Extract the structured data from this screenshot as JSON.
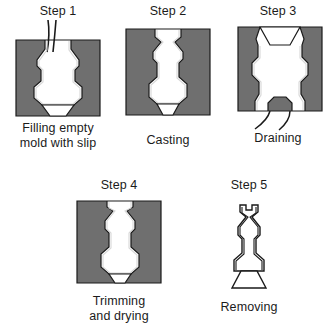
{
  "figure": {
    "background_color": "#ffffff",
    "mold_color": "#6f6f6f",
    "slip_color": "#ffffff",
    "outline_color": "#1a1a1a"
  },
  "steps": [
    {
      "id": "step-1",
      "title": "Step 1",
      "caption_lines": [
        "Filling empty",
        "mold with slip"
      ],
      "caption": "Filling empty mold with slip",
      "art": "mold-empty-with-pouring-slip"
    },
    {
      "id": "step-2",
      "title": "Step 2",
      "caption_lines": [
        "Casting"
      ],
      "caption": "Casting",
      "art": "mold-filled-with-slip"
    },
    {
      "id": "step-3",
      "title": "Step 3",
      "caption_lines": [
        "Draining"
      ],
      "caption": "Draining",
      "art": "mold-inverted-draining"
    },
    {
      "id": "step-4",
      "title": "Step 4",
      "caption_lines": [
        "Trimming",
        "and drying"
      ],
      "caption": "Trimming and drying",
      "art": "mold-with-trimmed-casting"
    },
    {
      "id": "step-5",
      "title": "Step 5",
      "caption_lines": [
        "Removing"
      ],
      "caption": "Removing",
      "art": "finished-hollow-casting"
    }
  ]
}
